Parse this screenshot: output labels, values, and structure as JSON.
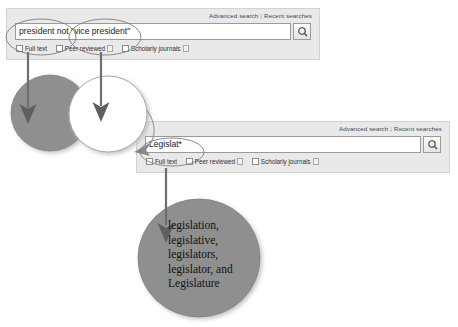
{
  "panels": [
    {
      "id": "panel-boolean-not",
      "links": {
        "advanced": "Advanced search",
        "separator": "|",
        "recent": "Recent searches"
      },
      "search": {
        "value": "president not \"vice president\"",
        "placeholder": "",
        "button_icon": "search-icon"
      },
      "options": [
        {
          "label": "Full text",
          "checked": false,
          "has_info": false
        },
        {
          "label": "Peer reviewed",
          "checked": false,
          "has_info": true
        },
        {
          "label": "Scholarly journals",
          "checked": false,
          "has_info": true
        }
      ]
    },
    {
      "id": "panel-truncation",
      "links": {
        "advanced": "Advanced search",
        "separator": "|",
        "recent": "Recent searches"
      },
      "search": {
        "value": "Legislat*",
        "placeholder": "",
        "button_icon": "search-icon"
      },
      "options": [
        {
          "label": "Full text",
          "checked": false,
          "has_info": false
        },
        {
          "label": "Peer reviewed",
          "checked": false,
          "has_info": true
        },
        {
          "label": "Scholarly journals",
          "checked": false,
          "has_info": true
        }
      ]
    }
  ],
  "annotations": {
    "highlight_left": "president not",
    "highlight_right": "\"vice president\"",
    "highlight_truncation": "Legislat*",
    "callout_text": "legislation, legislative, legislators, legislator, and Legislature",
    "callout_lines": [
      "legislation,",
      "legislative,",
      "legislators,",
      "legislator, and",
      "Legislature"
    ]
  },
  "colors": {
    "panel_bg": "#e9e9e9",
    "panel_border": "#d2d2d2",
    "field_bg": "#ffffff",
    "field_border": "#9a9a9a",
    "bubble_gray": "#8f8f8f",
    "bubble_white": "#ffffff",
    "outline_gray": "#9d9d9d",
    "arrow_gray": "#6e6e6e",
    "text_dark": "#111111",
    "link_text": "#3f4752"
  }
}
